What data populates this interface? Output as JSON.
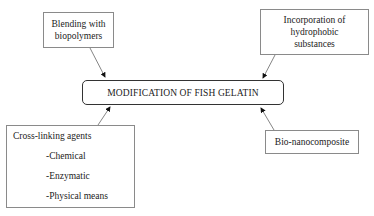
{
  "diagram": {
    "center": {
      "label": "MODIFICATION OF FISH GELATIN"
    },
    "nodes": {
      "blending": {
        "lines": [
          "Blending with",
          "biopolymers"
        ]
      },
      "incorporation": {
        "lines": [
          "Incorporation of",
          "hydrophobic",
          "substances"
        ]
      },
      "cross_linking": {
        "title": "Cross-linking agents",
        "items": [
          "-Chemical",
          "-Enzymatic",
          "-Physical means"
        ]
      },
      "bio_nano": {
        "label": "Bio-nanocomposite"
      }
    },
    "edges": [
      {
        "from": "blending",
        "to": "center"
      },
      {
        "from": "incorporation",
        "to": "center"
      },
      {
        "from": "cross_linking",
        "to": "center"
      },
      {
        "from": "bio_nano",
        "to": "center"
      }
    ]
  }
}
